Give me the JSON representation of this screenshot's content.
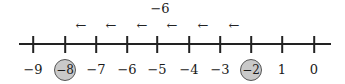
{
  "diagram": {
    "type": "number-line",
    "jump_label": "−6",
    "arrow_glyph": "←",
    "arrows": [
      {
        "x": 81
      },
      {
        "x": 111
      },
      {
        "x": 142
      },
      {
        "x": 172
      },
      {
        "x": 203
      },
      {
        "x": 234
      }
    ],
    "ticks": [
      {
        "label": "−9",
        "x": 33,
        "circled": false
      },
      {
        "label": "−8",
        "x": 65,
        "circled": true
      },
      {
        "label": "−7",
        "x": 96,
        "circled": false
      },
      {
        "label": "−6",
        "x": 127,
        "circled": false
      },
      {
        "label": "−5",
        "x": 157,
        "circled": false
      },
      {
        "label": "−4",
        "x": 189,
        "circled": false
      },
      {
        "label": "−3",
        "x": 220,
        "circled": false
      },
      {
        "label": "−2",
        "x": 251,
        "circled": true
      },
      {
        "label": "1",
        "x": 282,
        "circled": false
      },
      {
        "label": "0",
        "x": 314,
        "circled": false
      }
    ],
    "colors": {
      "line": "#222222",
      "circle_fill": "#c9c9c9",
      "circle_stroke": "#555555"
    }
  }
}
